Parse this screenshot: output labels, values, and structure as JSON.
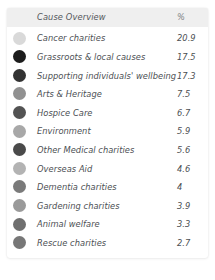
{
  "card": {
    "header": {
      "title": "Cause Overview",
      "value_column": "%"
    },
    "rows": [
      {
        "label": "Cancer charities",
        "value": "20.9",
        "color": "#d9d9d9"
      },
      {
        "label": "Grassroots & local causes",
        "value": "17.5",
        "color": "#1c1c1c"
      },
      {
        "label": "Supporting individuals' wellbeing",
        "value": "17.3",
        "color": "#333333"
      },
      {
        "label": "Arts & Heritage",
        "value": "7.5",
        "color": "#919191"
      },
      {
        "label": "Hospice Care",
        "value": "6.7",
        "color": "#535353"
      },
      {
        "label": "Environment",
        "value": "5.9",
        "color": "#a8a8a8"
      },
      {
        "label": "Other Medical charities",
        "value": "5.6",
        "color": "#4a4a4a"
      },
      {
        "label": "Overseas Aid",
        "value": "4.6",
        "color": "#b3b3b3"
      },
      {
        "label": "Dementia charities",
        "value": "4",
        "color": "#7a7a7a"
      },
      {
        "label": "Gardening charities",
        "value": "3.9",
        "color": "#9a9a9a"
      },
      {
        "label": "Animal welfare",
        "value": "3.3",
        "color": "#6f6f6f"
      },
      {
        "label": "Rescue charities",
        "value": "2.7",
        "color": "#777777"
      }
    ]
  },
  "chart_data": {
    "type": "table",
    "title": "Cause Overview",
    "columns": [
      "Cause Overview",
      "%"
    ],
    "categories": [
      "Cancer charities",
      "Grassroots & local causes",
      "Supporting individuals' wellbeing",
      "Arts & Heritage",
      "Hospice Care",
      "Environment",
      "Other Medical charities",
      "Overseas Aid",
      "Dementia charities",
      "Gardening charities",
      "Animal welfare",
      "Rescue charities"
    ],
    "values": [
      20.9,
      17.5,
      17.3,
      7.5,
      6.7,
      5.9,
      5.6,
      4.6,
      4,
      3.9,
      3.3,
      2.7
    ],
    "ylabel": "%",
    "xlabel": "",
    "legend": "swatch-per-row",
    "grid": false
  }
}
